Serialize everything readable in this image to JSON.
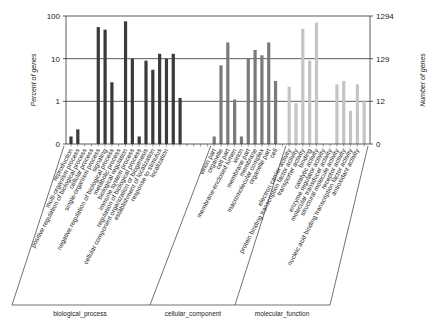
{
  "chart_data": {
    "type": "bar",
    "title": "",
    "xlabel": "",
    "ylabel": "Percent of genes",
    "ylabel_right": "Number of genes",
    "yscale": "log",
    "yticks_left": [
      "100",
      "10",
      "1",
      "0"
    ],
    "yticks_right": [
      "1294",
      "129",
      "12",
      "0"
    ],
    "ylim": [
      0.1,
      100
    ],
    "grid": true,
    "legend": null,
    "groups": [
      {
        "name": "biological_process",
        "color": "#3a3a3a",
        "start": 0,
        "count": 21
      },
      {
        "name": "cellular_component",
        "color": "#7a7a7a",
        "start": 21,
        "count": 11
      },
      {
        "name": "molecular_function",
        "color": "#c4c4c4",
        "start": 32,
        "count": 12
      }
    ],
    "categories": [
      "reproduction",
      "multi-organism process",
      "positive regulation of biological process",
      "cellular process",
      "single-organism process",
      "signaling",
      "negative regulation of biological process",
      "metabolic process",
      "biological regulation",
      "immune system process",
      "regulation of biological process",
      "cellular component organization or biogenesis",
      "establishment of localization",
      "response to stimulus",
      "localization",
      "",
      "",
      "",
      "",
      "",
      "",
      "virion part",
      "organelle",
      "cell part",
      "membrane-enclosed lumen",
      "virion",
      "membrane part",
      "membrane",
      "macromolecular complex",
      "organelle part",
      "cell",
      "",
      "electron carrier activity",
      "protein binding transcription factor activity",
      "transporter activity",
      "binding",
      "catalytic activity",
      "enzyme regulator activity",
      "molecular transducer activity",
      "structural molecule activity",
      "receptor activity",
      "nucleic acid binding transcription factor activity",
      "antioxidant activity",
      ""
    ],
    "series": [
      {
        "name": "Percent of genes",
        "values": [
          0.15,
          0.22,
          0,
          0,
          55,
          48,
          2.8,
          0,
          75,
          10,
          0.15,
          9,
          5.5,
          13,
          10,
          13,
          1.2,
          0,
          0,
          0,
          0,
          0.15,
          7,
          24,
          1.1,
          0.15,
          10,
          16,
          12,
          24,
          3,
          0,
          2.2,
          0.9,
          50,
          9,
          70,
          0,
          0,
          2.5,
          3,
          0.6,
          2.5,
          1
        ]
      }
    ]
  },
  "labels": {
    "ylabel_left": "Percent of genes",
    "ylabel_right": "Number of genes",
    "group_bp": "biological_process",
    "group_cc": "cellular_component",
    "group_mf": "molecular_function"
  }
}
